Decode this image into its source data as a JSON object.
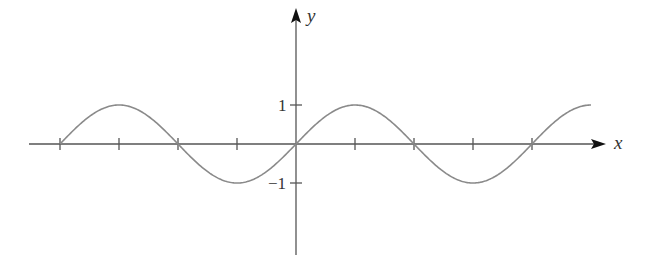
{
  "chart_data": {
    "type": "line",
    "title": "",
    "function": "y = sin(x)",
    "xlabel": "x",
    "ylabel": "y",
    "xlim": [
      -7.85,
      7.85
    ],
    "ylim": [
      -2.0,
      2.5
    ],
    "x_ticks": [
      -6.2832,
      -4.7124,
      -3.1416,
      -1.5708,
      0,
      1.5708,
      3.1416,
      4.7124,
      6.2832
    ],
    "x_tick_labels": [],
    "y_ticks": [
      1,
      -1
    ],
    "y_tick_labels": [
      "1",
      "−1"
    ],
    "grid": false,
    "legend": null,
    "series": [
      {
        "name": "sin(x)",
        "x_range": [
          -6.2832,
          7.854
        ],
        "color": "#8a8a8a"
      }
    ],
    "axis_color": "#555555"
  },
  "axes": {
    "x_label": "x",
    "y_label": "y",
    "y_tick_1": "1",
    "y_tick_neg1": "−1"
  }
}
